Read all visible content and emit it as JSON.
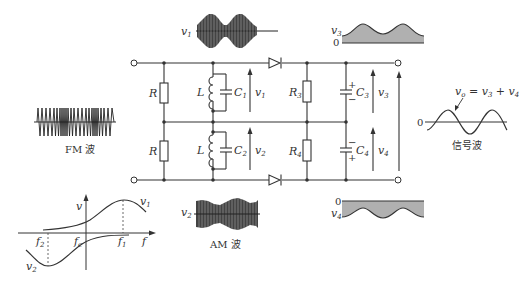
{
  "diagram": {
    "labels": {
      "R_top": "R",
      "R_bottom": "R",
      "L_top": "L",
      "L_bottom": "L",
      "C1": "C",
      "C1_sub": "1",
      "C2": "C",
      "C2_sub": "2",
      "R3": "R",
      "R3_sub": "3",
      "R4": "R",
      "R4_sub": "4",
      "C3": "C",
      "C3_sub": "3",
      "C4": "C",
      "C4_sub": "4",
      "v1": "v",
      "v1_sub": "1",
      "v2": "v",
      "v2_sub": "2",
      "v3": "v",
      "v3_sub": "3",
      "v4": "v",
      "v4_sub": "4",
      "plus": "+",
      "minus": "−"
    },
    "waveforms": {
      "fm_caption": "FM 波",
      "am_caption": "AM 波",
      "signal_caption": "信号波",
      "v1_wave_label": "v",
      "v1_wave_sub": "1",
      "v2_wave_label": "v",
      "v2_wave_sub": "2",
      "v3_wave_label": "v",
      "v3_wave_sub": "3",
      "v3_zero": "0",
      "v4_wave_label": "v",
      "v4_wave_sub": "4",
      "v4_zero": "0",
      "signal_zero": "0",
      "vo_equation": "v",
      "vo_sub": "o",
      "vo_rhs": " = v",
      "vo_rhs_sub1": "3",
      "vo_plus": " + v",
      "vo_rhs_sub2": "4"
    },
    "response_plot": {
      "y_axis_label": "v",
      "x_axis_label": "f",
      "f2_label": "f",
      "f2_sub": "2",
      "fc_label": "f",
      "fc_sub": "c",
      "f1_label": "f",
      "f1_sub": "1",
      "v1_curve_label": "v",
      "v1_curve_sub": "1",
      "v2_curve_label": "v",
      "v2_curve_sub": "2"
    },
    "colors": {
      "line": "#333333",
      "fill_gray": "#b0b0b0",
      "background": "#ffffff"
    }
  }
}
